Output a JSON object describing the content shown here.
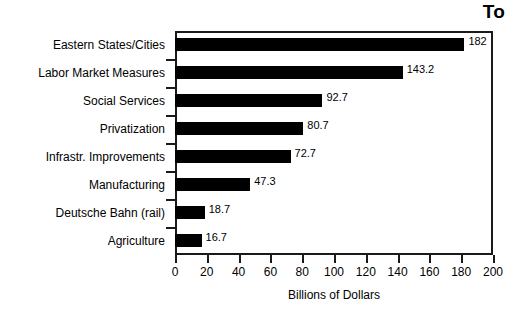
{
  "chart_data": {
    "type": "bar",
    "orientation": "horizontal",
    "title": "To",
    "title_note": "title is cropped at the top-right of the image",
    "xlabel": "Billions of Dollars",
    "ylabel": "",
    "xlim": [
      0,
      200
    ],
    "xticks": [
      0,
      20,
      40,
      60,
      80,
      100,
      120,
      140,
      160,
      180,
      200
    ],
    "xtick_labels": [
      "0",
      "20",
      "40",
      "60",
      "80",
      "100",
      "120",
      "140",
      "160",
      "180",
      "200"
    ],
    "grid": false,
    "legend": false,
    "bar_color": "#000000",
    "frame_color": "#1a1a1a",
    "background": "#ffffff",
    "categories": [
      "Eastern States/Cities",
      "Labor Market Measures",
      "Social Services",
      "Privatization",
      "Infrastr. Improvements",
      "Manufacturing",
      "Deutsche Bahn (rail)",
      "Agriculture"
    ],
    "values": [
      182,
      143.2,
      92.7,
      80.7,
      72.7,
      47.3,
      18.7,
      16.7
    ],
    "value_labels": [
      "182",
      "143.2",
      "92.7",
      "80.7",
      "72.7",
      "47.3",
      "18.7",
      "16.7"
    ]
  }
}
